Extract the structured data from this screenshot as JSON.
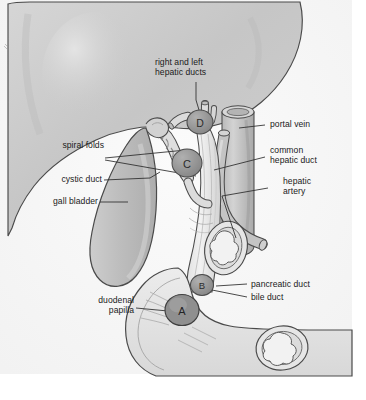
{
  "figure": {
    "background_color": "#ffffff",
    "plate_color": "#f7f7f7",
    "ink_color": "#3a3a3a",
    "organ_fill": "#c9c9c9",
    "duct_fill": "#ededed",
    "marker_fill": "#9a9a9a",
    "text_color": "#1b1b1b"
  },
  "labels": {
    "hepatic_ducts": "right and left\nhepatic ducts",
    "spiral_folds": "spiral folds",
    "cystic_duct": "cystic duct",
    "gall_bladder": "gall bladder",
    "duodenal_papilla": "duodenal\npapilla",
    "portal_vein": "portal vein",
    "common_hepatic_duct": "common\nhepatic duct",
    "hepatic_artery": "hepatic\nartery",
    "pancreatic_duct": "pancreatic duct",
    "bile_duct": "bile duct"
  },
  "markers": [
    {
      "id": "A",
      "label": "A",
      "structure": "duodenal papilla"
    },
    {
      "id": "B",
      "label": "B",
      "structure": "pancreatic duct junction"
    },
    {
      "id": "C",
      "label": "C",
      "structure": "cystic duct / spiral folds"
    },
    {
      "id": "D",
      "label": "D",
      "structure": "hepatic duct confluence"
    }
  ]
}
